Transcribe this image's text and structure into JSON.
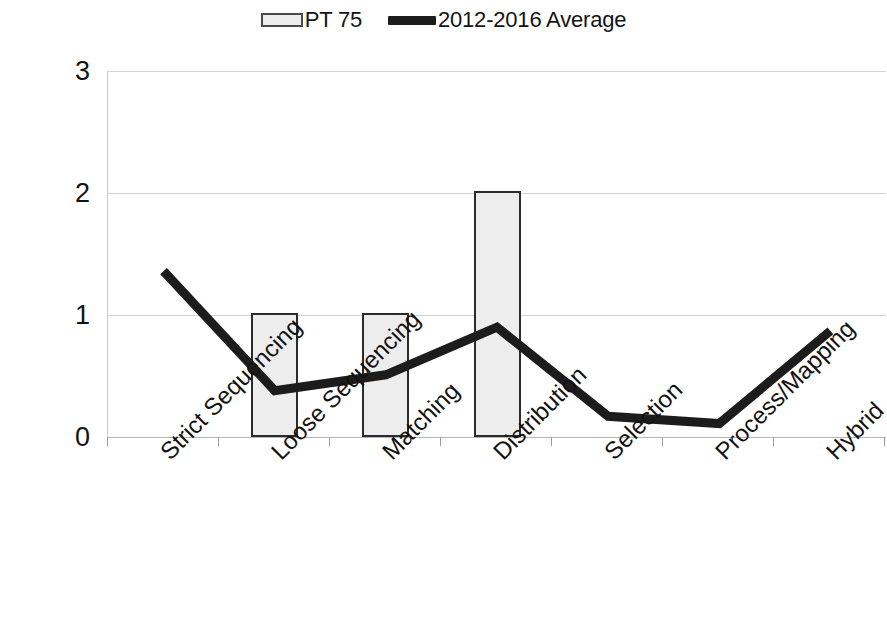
{
  "legend": {
    "entries": [
      {
        "label": "PT 75",
        "marker": "bar-swatch-icon",
        "color": "#ededed"
      },
      {
        "label": "2012-2016 Average",
        "marker": "line-swatch-icon",
        "color": "#1c1c1c"
      }
    ]
  },
  "axis": {
    "y_ticks": [
      "0",
      "1",
      "2",
      "3"
    ],
    "x_categories": [
      "Strict Sequencing",
      "Loose Sequencing",
      "Matching",
      "Distribution",
      "Selection",
      "Process/Mapping",
      "Hybrid"
    ]
  },
  "chart_data": {
    "type": "bar",
    "title": "",
    "subtitle": "",
    "xlabel": "",
    "ylabel": "",
    "ylim": [
      0,
      3
    ],
    "yticks": [
      0,
      1,
      2,
      3
    ],
    "grid": true,
    "legend_position": "top-center",
    "categories": [
      "Strict Sequencing",
      "Loose Sequencing",
      "Matching",
      "Distribution",
      "Selection",
      "Process/Mapping",
      "Hybrid"
    ],
    "series": [
      {
        "name": "PT 75",
        "type": "bar",
        "color": "#ededed",
        "edge_color": "#2b2b2b",
        "values": [
          0,
          1.02,
          1.02,
          2.02,
          0,
          0,
          0
        ]
      },
      {
        "name": "2012-2016 Average",
        "type": "line",
        "color": "#1c1c1c",
        "line_width": 9,
        "values": [
          1.36,
          0.38,
          0.51,
          0.9,
          0.17,
          0.11,
          0.87
        ]
      }
    ]
  }
}
